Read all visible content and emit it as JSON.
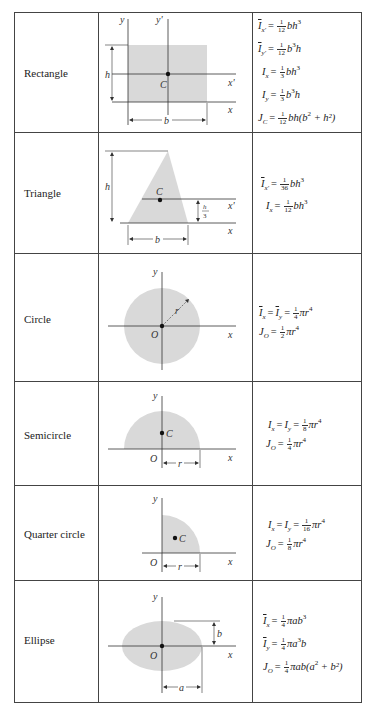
{
  "table": {
    "rows": [
      {
        "name": "Rectangle",
        "diagram": {
          "shape": "rectangle",
          "labels": {
            "y": "y",
            "y_prime": "y'",
            "x": "x",
            "x_prime": "x'",
            "centroid": "C",
            "height": "h",
            "base": "b"
          }
        },
        "formulas": [
          {
            "lhs_sym": "I",
            "lhs_bar": true,
            "lhs_sub": "x'",
            "num": "1",
            "den": "12",
            "rhs": "bh",
            "rhs_sup": "3",
            "rhs_tail": ""
          },
          {
            "lhs_sym": "I",
            "lhs_bar": true,
            "lhs_sub": "y'",
            "num": "1",
            "den": "12",
            "rhs": "b",
            "rhs_sup": "3",
            "rhs_tail": "h"
          },
          {
            "lhs_sym": "I",
            "lhs_bar": false,
            "lhs_sub": "x",
            "num": "1",
            "den": "3",
            "rhs": "bh",
            "rhs_sup": "3",
            "rhs_tail": ""
          },
          {
            "lhs_sym": "I",
            "lhs_bar": false,
            "lhs_sub": "y",
            "num": "1",
            "den": "3",
            "rhs": "b",
            "rhs_sup": "3",
            "rhs_tail": "h"
          },
          {
            "lhs_sym": "J",
            "lhs_bar": false,
            "lhs_sub": "C",
            "num": "1",
            "den": "12",
            "rhs": "bh(b",
            "rhs_sup": "2",
            "rhs_tail": " + h²)"
          }
        ]
      },
      {
        "name": "Triangle",
        "diagram": {
          "shape": "triangle",
          "labels": {
            "x": "x",
            "x_prime": "x'",
            "centroid": "C",
            "height": "h",
            "base": "b",
            "third_num": "h",
            "third_den": "3"
          }
        },
        "formulas": [
          {
            "lhs_sym": "I",
            "lhs_bar": true,
            "lhs_sub": "x'",
            "num": "1",
            "den": "36",
            "rhs": "bh",
            "rhs_sup": "3",
            "rhs_tail": ""
          },
          {
            "lhs_sym": "I",
            "lhs_bar": false,
            "lhs_sub": "x",
            "num": "1",
            "den": "12",
            "rhs": "bh",
            "rhs_sup": "3",
            "rhs_tail": ""
          }
        ]
      },
      {
        "name": "Circle",
        "diagram": {
          "shape": "circle",
          "labels": {
            "y": "y",
            "x": "x",
            "origin": "O",
            "radius": "r"
          }
        },
        "formulas": [
          {
            "text_lhs": "I̅x = I̅y =",
            "num": "1",
            "den": "4",
            "rhs": "πr",
            "rhs_sup": "4"
          },
          {
            "text_lhs": "JO =",
            "num": "1",
            "den": "2",
            "rhs": "πr",
            "rhs_sup": "4"
          }
        ]
      },
      {
        "name": "Semicircle",
        "diagram": {
          "shape": "semicircle",
          "labels": {
            "y": "y",
            "x": "x",
            "origin": "O",
            "centroid": "C",
            "radius": "r"
          }
        },
        "formulas": [
          {
            "text_lhs": "Ix = Iy =",
            "num": "1",
            "den": "8",
            "rhs": "πr",
            "rhs_sup": "4"
          },
          {
            "text_lhs": "JO =",
            "num": "1",
            "den": "4",
            "rhs": "πr",
            "rhs_sup": "4"
          }
        ]
      },
      {
        "name": "Quarter circle",
        "diagram": {
          "shape": "quarter-circle",
          "labels": {
            "y": "y",
            "x": "x",
            "origin": "O",
            "centroid": "C",
            "radius": "r"
          }
        },
        "formulas": [
          {
            "text_lhs": "Ix = Iy =",
            "num": "1",
            "den": "16",
            "rhs": "πr",
            "rhs_sup": "4"
          },
          {
            "text_lhs": "JO =",
            "num": "1",
            "den": "8",
            "rhs": "πr",
            "rhs_sup": "4"
          }
        ]
      },
      {
        "name": "Ellipse",
        "diagram": {
          "shape": "ellipse",
          "labels": {
            "y": "y",
            "x": "x",
            "origin": "O",
            "semi_major": "a",
            "semi_minor": "b"
          }
        },
        "formulas": [
          {
            "text_lhs": "I̅x =",
            "num": "1",
            "den": "4",
            "rhs": "πab",
            "rhs_sup": "3",
            "rhs_tail": ""
          },
          {
            "text_lhs": "I̅y =",
            "num": "1",
            "den": "4",
            "rhs": "πa",
            "rhs_sup": "3",
            "rhs_tail": "b"
          },
          {
            "text_lhs": "JO =",
            "num": "1",
            "den": "4",
            "rhs": "πab(a",
            "rhs_sup": "2",
            "rhs_tail": " + b²)"
          }
        ]
      }
    ]
  },
  "colors": {
    "fill": "#d9d9d9",
    "line": "#333333",
    "border": "#444444"
  }
}
